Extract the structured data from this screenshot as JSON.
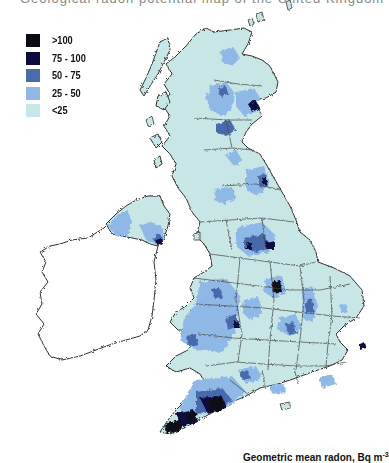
{
  "header": {
    "cut_text": "Geological radon potential map of the United Kingdom"
  },
  "legend": {
    "title": "",
    "items": [
      {
        "label": ">100",
        "color": "#0a0a14"
      },
      {
        "label": "75 - 100",
        "color": "#0a0c40"
      },
      {
        "label": "50 - 75",
        "color": "#4a6aaa"
      },
      {
        "label": "25 - 50",
        "color": "#8fb8e6"
      },
      {
        "label": "<25",
        "color": "#c8e6e6"
      }
    ]
  },
  "caption": {
    "text": "Geometric mean radon, Bq m",
    "superscript": "-3"
  },
  "map": {
    "regions": [
      {
        "name": "Scotland",
        "dominant_class": "<25",
        "notes": "patches 25-50 in Highlands; 75-100 near Aberdeen"
      },
      {
        "name": "Northern Ireland",
        "dominant_class": "25-50",
        "notes": "50-75 patches near borders"
      },
      {
        "name": "Ireland (Republic)",
        "dominant_class": "no data",
        "notes": "outline only"
      },
      {
        "name": "Northern England",
        "dominant_class": "<25",
        "notes": "75-100 hotspot in North Pennines; Peak District 75-100"
      },
      {
        "name": "Midlands",
        "dominant_class": "<25",
        "notes": ">100 hotspot in Northamptonshire; 50-75 bands"
      },
      {
        "name": "Wales",
        "dominant_class": "25-50",
        "notes": "50-75 patches"
      },
      {
        "name": "South West England",
        "dominant_class": ">100",
        "notes": "Cornwall and Devon (Dartmoor) highest"
      },
      {
        "name": "East Anglia & South East",
        "dominant_class": "<25"
      }
    ],
    "colors": {
      "outline": "#333333",
      "no_data": "#ffffff"
    }
  }
}
